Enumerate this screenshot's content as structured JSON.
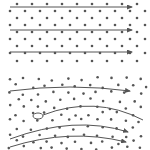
{
  "diagram": {
    "title": "",
    "colors": {
      "atom": "#555555",
      "path": "#555555",
      "background": "#ffffff"
    },
    "panels": [
      {
        "id": "perfect-lattice",
        "description": "Regular lattice with straight electron paths",
        "lattice": {
          "rows_y": [
            4,
            11,
            18,
            25,
            32,
            39,
            46,
            53,
            61
          ],
          "x_start_even": 17,
          "x_start_odd": 10,
          "spacing": 15,
          "cols": 10
        },
        "paths": [
          {
            "type": "straight-arrow",
            "x1": 10,
            "y1": 7,
            "x2": 132,
            "y2": 7
          },
          {
            "type": "straight-arrow",
            "x1": 10,
            "y1": 30,
            "x2": 132,
            "y2": 30
          },
          {
            "type": "straight-arrow",
            "x1": 10,
            "y1": 52,
            "x2": 132,
            "y2": 52
          }
        ]
      },
      {
        "id": "imperfect-lattice",
        "description": "Irregular lattice with curved, scattered electron paths",
        "paths": [
          {
            "type": "curved-arrow",
            "d": "M10,91 Q70,83 130,91"
          },
          {
            "type": "curved-line-with-start-marker",
            "d": "M43,115 Q95,95 143,120",
            "marker": {
              "cx": 38,
              "cy": 116,
              "rx": 5,
              "ry": 3
            }
          },
          {
            "type": "curved-arrow",
            "d": "M10,139 Q75,115 128,132"
          },
          {
            "type": "curved-arrow",
            "d": "M10,147 Q70,128 126,142"
          }
        ]
      }
    ]
  }
}
